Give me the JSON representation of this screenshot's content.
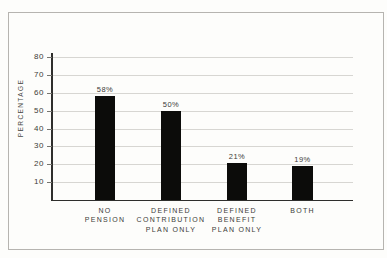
{
  "figure": {
    "type": "scanned-book-figure"
  },
  "chart_data": {
    "type": "bar",
    "title": "",
    "xlabel": "",
    "ylabel": "PERCENTAGE",
    "categories": [
      "NO\nPENSION",
      "DEFINED\nCONTRIBUTION\nPLAN ONLY",
      "DEFINED\nBENEFIT\nPLAN ONLY",
      "BOTH"
    ],
    "values": [
      58,
      50,
      21,
      19
    ],
    "data_labels": [
      "58%",
      "50%",
      "21%",
      "19%"
    ],
    "yticks": [
      10,
      20,
      30,
      40,
      50,
      60,
      70,
      80
    ],
    "ylim": [
      0,
      82
    ],
    "grid": true,
    "legend": false,
    "colors": {
      "bar": "#0c0c0a",
      "gridline": "#d7d6d2",
      "axis": "#2e2e2c",
      "text": "#3c3c38",
      "frame_border": "#b6b4b0",
      "background": "#fdfdfb"
    }
  }
}
